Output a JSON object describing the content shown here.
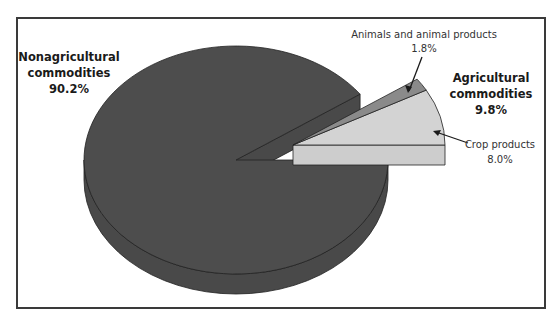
{
  "chart_data": {
    "type": "pie",
    "style": "3d-exploded",
    "title": "",
    "slices": [
      {
        "name": "Nonagricultural commodities",
        "value": 90.2,
        "label_pct": "90.2%",
        "color": "#4d4d4d"
      },
      {
        "name": "Crop products",
        "value": 8.0,
        "label_pct": "8.0%",
        "color": "#d3d3d3",
        "group": "Agricultural commodities"
      },
      {
        "name": "Animals and animal products",
        "value": 1.8,
        "label_pct": "1.8%",
        "color": "#8a8a8a",
        "group": "Agricultural commodities"
      }
    ],
    "groups": [
      {
        "name": "Agricultural commodities",
        "value": 9.8,
        "label_pct": "9.8%",
        "exploded": true
      }
    ],
    "labels": {
      "nonag_line1": "Nonagricultural",
      "nonag_line2": "commodities",
      "nonag_pct": "90.2%",
      "ag_line1": "Agricultural",
      "ag_line2": "commodities",
      "ag_pct": "9.8%",
      "animal_line1": "Animals and animal products",
      "animal_pct": "1.8%",
      "crop_line1": "Crop products",
      "crop_pct": "8.0%"
    },
    "legend": "none"
  }
}
